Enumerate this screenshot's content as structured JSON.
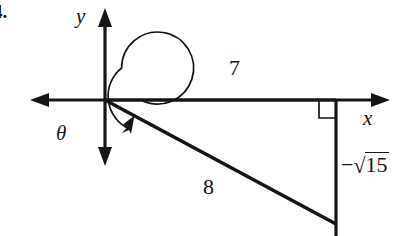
{
  "figure": {
    "kind": "trigonometry-reference-triangle-diagram",
    "problem_number": "4.",
    "background_color": "#ffffff",
    "ink_color": "#151515",
    "axes": {
      "x_label": "x",
      "y_label": "y",
      "origin": {
        "x": 105,
        "y": 100
      },
      "x_axis_from": {
        "x": 30,
        "y": 100
      },
      "x_axis_to": {
        "x": 390,
        "y": 100
      },
      "y_axis_from": {
        "x": 105,
        "y": 8
      },
      "y_axis_to": {
        "x": 105,
        "y": 166
      },
      "arrowheads": [
        "x-negative",
        "x-positive",
        "y-positive",
        "y-negative"
      ]
    },
    "angle": {
      "label": "θ",
      "arc_radius": 36,
      "sweep": "counterclockwise",
      "sweep_description": "nearly full revolution from positive x-axis to terminal ray in quadrant IV",
      "arrow_at": "terminal-ray"
    },
    "triangle": {
      "adjacent_label": "7",
      "hypotenuse_label": "8",
      "opposite_label_sign": "−",
      "opposite_label_radical_sign": "√",
      "opposite_label_radicand": "15",
      "opposite_label_text": "−√15",
      "right_angle_marker": true,
      "right_angle_vertex": {
        "x": 336,
        "y": 100
      },
      "terminal_point": {
        "x": 336,
        "y": 224
      },
      "right_angle_marker_size": 17
    }
  }
}
